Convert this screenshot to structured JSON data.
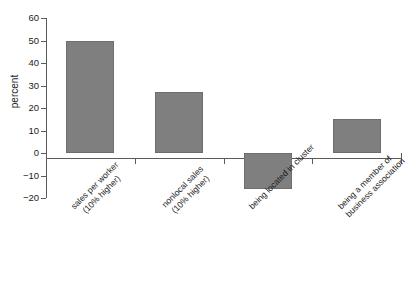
{
  "chart_data": {
    "type": "bar",
    "title": "",
    "xlabel": "",
    "ylabel": "percent",
    "ylim": [
      -20,
      60
    ],
    "yticks": [
      -20,
      -10,
      0,
      10,
      20,
      30,
      40,
      50,
      60
    ],
    "ytick_labels": [
      "−20",
      "−10",
      "0",
      "10",
      "20",
      "30",
      "40",
      "50",
      "60"
    ],
    "grid": false,
    "legend": null,
    "bar_color": "#7f7f7f",
    "axis_color": "#5a5a5a",
    "categories": [
      "sales per worker (10% higher)",
      "nonlocal sales (10% higher)",
      "being located in cluster",
      "being a member of business association"
    ],
    "category_lines": [
      [
        "sales per worker",
        "(10% higher)"
      ],
      [
        "nonlocal sales",
        "(10% higher)"
      ],
      [
        "being located in cluster"
      ],
      [
        "being a member of",
        "business association"
      ]
    ],
    "values": [
      50,
      27,
      -16,
      15
    ]
  }
}
